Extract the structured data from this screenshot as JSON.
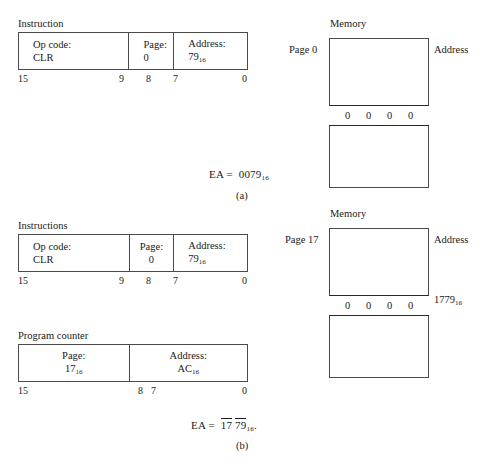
{
  "figure": {
    "panels": [
      {
        "id": "a",
        "part_label": "(a)",
        "instruction": {
          "heading": "Instruction",
          "fields": [
            {
              "line1": "Op code:",
              "line2": "CLR",
              "align": "left"
            },
            {
              "line1": "Page:",
              "line2": "0",
              "align": "left"
            },
            {
              "line1": "Address:",
              "line2": "79",
              "line2_sub": "16",
              "align": "left"
            }
          ],
          "bits": [
            "15",
            "9",
            "8",
            "7",
            "0"
          ]
        },
        "memory": {
          "heading": "Memory",
          "page_label": "Page 0",
          "address_label": "Address",
          "row_cells": [
            "0",
            "0",
            "0",
            "0"
          ],
          "row_address": ""
        },
        "ea": {
          "prefix": "EA =",
          "value": "0079",
          "value_sub": "16",
          "overline": false
        }
      },
      {
        "id": "b",
        "part_label": "(b)",
        "instruction": {
          "heading": "Instructions",
          "fields": [
            {
              "line1": "Op code:",
              "line2": "CLR",
              "align": "left"
            },
            {
              "line1": "Page:",
              "line2": "0",
              "align": "center"
            },
            {
              "line1": "Address:",
              "line2": "79",
              "line2_sub": "16",
              "align": "left"
            }
          ],
          "bits": [
            "15",
            "9",
            "8",
            "7",
            "0"
          ]
        },
        "program_counter": {
          "heading": "Program counter",
          "fields": [
            {
              "line1": "Page:",
              "line2": "17",
              "line2_sub": "16",
              "align": "center"
            },
            {
              "line1": "Address:",
              "line2": "AC",
              "line2_sub": "16",
              "align": "center"
            }
          ],
          "bits": [
            "15",
            "8",
            "7",
            "0"
          ]
        },
        "memory": {
          "heading": "Memory",
          "page_label": "Page  17",
          "address_label": "Address",
          "row_cells": [
            "0",
            "0",
            "0",
            "0"
          ],
          "row_address": "1779",
          "row_address_sub": "16"
        },
        "ea": {
          "prefix": "EA =",
          "part1": "17",
          "part2": "79",
          "value_sub": "16",
          "suffix": ".",
          "overline": true
        }
      }
    ]
  },
  "colors": {
    "background": "#ffffff",
    "text": "#1a1a1a",
    "border": "#4a4a4a",
    "row_border": "#2a2a2a"
  }
}
